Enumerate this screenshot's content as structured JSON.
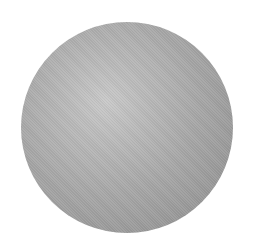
{
  "image": {
    "subject": "gray sphere",
    "colors": {
      "background": "#ffffff",
      "highlight": "#c9c9c9",
      "midtone": "#a5a5a5",
      "edge": "#8e8e8e"
    }
  }
}
